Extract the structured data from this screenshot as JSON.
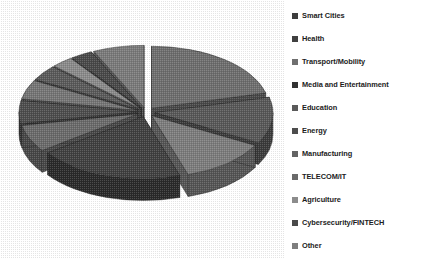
{
  "chart_data": {
    "type": "pie",
    "title": "",
    "subtitle": "",
    "xlabel": "",
    "ylabel": "",
    "style": "exploded-3d-pie",
    "grid": false,
    "legend_position": "right",
    "palette": "grayscale",
    "categories": [
      "Smart Cities",
      "Health",
      "Transport/Mobility",
      "Media and Entertainment",
      "Education",
      "Energy",
      "Manufacturing",
      "TELECOM/IT",
      "Agriculture",
      "Cybersecurity/FINTECH",
      "Other"
    ],
    "values": [
      21,
      12,
      12,
      20,
      7,
      6,
      5,
      4,
      3,
      3,
      7
    ],
    "slices": [
      {
        "label": "Smart Cities",
        "value": 21,
        "color": "#6e6e6e",
        "side_color": "#4a4a4a"
      },
      {
        "label": "Health",
        "value": 12,
        "color": "#585858",
        "side_color": "#3a3a3a"
      },
      {
        "label": "Transport/Mobility",
        "value": 12,
        "color": "#7c7c7c",
        "side_color": "#545454"
      },
      {
        "label": "Media and Entertainment",
        "value": 20,
        "color": "#3f3f3f",
        "side_color": "#2a2a2a"
      },
      {
        "label": "Education",
        "value": 7,
        "color": "#6a6a6a",
        "side_color": "#464646"
      },
      {
        "label": "Energy",
        "value": 6,
        "color": "#4e4e4e",
        "side_color": "#343434"
      },
      {
        "label": "Manufacturing",
        "value": 5,
        "color": "#747474",
        "side_color": "#4e4e4e"
      },
      {
        "label": "TELECOM/IT",
        "value": 4,
        "color": "#5a5a5a",
        "side_color": "#3c3c3c"
      },
      {
        "label": "Agriculture",
        "value": 3,
        "color": "#8a8a8a",
        "side_color": "#5c5c5c"
      },
      {
        "label": "Cybersecurity/FINTECH",
        "value": 3,
        "color": "#4a4a4a",
        "side_color": "#303030"
      },
      {
        "label": "Other",
        "value": 7,
        "color": "#7a7a7a",
        "side_color": "#525252"
      }
    ]
  },
  "legend": {
    "items": [
      {
        "label": "Smart Cities",
        "color": "#3d3d3d"
      },
      {
        "label": "Health",
        "color": "#404040"
      },
      {
        "label": "Transport/Mobility",
        "color": "#6f6f6f"
      },
      {
        "label": "Media and Entertainment",
        "color": "#323232"
      },
      {
        "label": "Education",
        "color": "#5a5a5a"
      },
      {
        "label": "Energy",
        "color": "#4d4d4d"
      },
      {
        "label": "Manufacturing",
        "color": "#636363"
      },
      {
        "label": "TELECOM/IT",
        "color": "#6a6a6a"
      },
      {
        "label": "Agriculture",
        "color": "#8c8c8c"
      },
      {
        "label": "Cybersecurity/FINTECH",
        "color": "#4a4a4a"
      },
      {
        "label": "Other",
        "color": "#7e7e7e"
      }
    ]
  }
}
